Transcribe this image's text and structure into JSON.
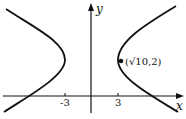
{
  "figure": {
    "type": "hyperbola-graph",
    "axes": {
      "x_label": "x",
      "y_label": "y",
      "ticks": [
        {
          "value": -3,
          "label": "-3"
        },
        {
          "value": 3,
          "label": "3"
        }
      ]
    },
    "curve": {
      "description": "horizontal hyperbola with vertices at x = -3 and x = 3",
      "color": "#111111"
    },
    "point": {
      "label": "(√10,2)",
      "x": "√10",
      "y": 2
    }
  }
}
